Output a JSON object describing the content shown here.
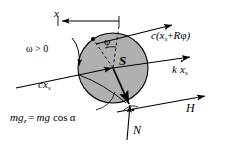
{
  "figure": {
    "type": "free-body-diagram",
    "width": 227,
    "height": 145,
    "background_color": "#ffffff",
    "stroke_color": "#000000",
    "body_fill_color": "#b0b0b0",
    "center_marker_color": "#ffffff"
  },
  "body": {
    "shape": "circle",
    "center_label": "S",
    "center_x": 113,
    "center_y": 68,
    "radius": 35,
    "fill": "#b0b0b0"
  },
  "labels": {
    "displacement": "x",
    "angular_velocity_condition": "ω > 0",
    "rotation_angle": "φ",
    "center_of_mass": "S",
    "spring_force": {
      "prefix": "c(",
      "term1": "x",
      "term1_sub": "s",
      "plus": "+",
      "term2": "R",
      "term3": "φ",
      "suffix": ")",
      "full": "c(xₛ + Rφ)"
    },
    "damper_force": {
      "prefix": "k",
      "variable": "x",
      "sub": "s",
      "full": "k ẋₛ",
      "note": "k x-dot sub s"
    },
    "damping_force_left": {
      "prefix": "c",
      "variable": "x",
      "sub": "s",
      "full": "cxₛ"
    },
    "friction_force": "H",
    "normal_force": "N",
    "weight_component": {
      "lhs_main": "mg",
      "lhs_sub": "z",
      "equals": "=",
      "rhs_main": "mg",
      "rhs_func": "cos",
      "rhs_arg": "α",
      "full": "mgₓ = mg cos α"
    }
  },
  "vectors": [
    {
      "name": "spring-force-arrow",
      "label": "c(xₛ + Rφ)",
      "direction": "up-right"
    },
    {
      "name": "damper-force-arrow",
      "label": "k ẋₛ",
      "direction": "up-right"
    },
    {
      "name": "damping-force-arrow",
      "label": "cxₛ",
      "direction": "up-right"
    },
    {
      "name": "friction-force-arrow",
      "label": "H",
      "direction": "up-right"
    },
    {
      "name": "normal-force-arrow",
      "label": "N",
      "direction": "up"
    },
    {
      "name": "weight-arrow",
      "label": "mgₓ = mg cos α",
      "direction": "down"
    },
    {
      "name": "omega-arrow",
      "label": "ω > 0",
      "direction": "clockwise-curve"
    },
    {
      "name": "displacement-arrow",
      "label": "x",
      "direction": "left"
    }
  ],
  "markers": {
    "right_angle_symbol": "·",
    "contact_point_note": "right-angle dot at contact between disc and ground line"
  }
}
